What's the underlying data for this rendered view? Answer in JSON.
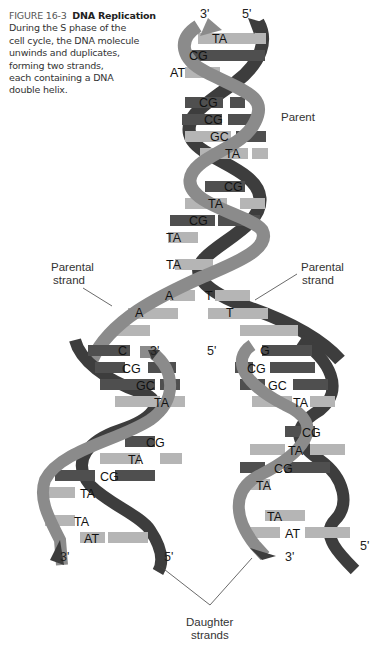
{
  "caption": {
    "figure_number": "FIGURE 16-3",
    "title": "DNA Replication",
    "lines": [
      "During the S phase of the",
      "cell cycle, the DNA molecule",
      "unwinds and duplicates,",
      "forming two strands,",
      "each containing a DNA",
      "double helix."
    ]
  },
  "labels": {
    "parent": "Parent",
    "parental_strand_left": [
      "Parental",
      "strand"
    ],
    "parental_strand_right": [
      "Parental",
      "strand"
    ],
    "daughter_strands": [
      "Daughter",
      "strands"
    ]
  },
  "strand_ends": {
    "top_left": "3'",
    "top_right": "5'",
    "left_helix_top": "3'",
    "right_helix_top": "5'",
    "left_helix_bottom_left": "3'",
    "left_helix_bottom_right": "5'",
    "right_helix_bottom_left": "3'",
    "right_helix_bottom_right": "5'"
  },
  "base_pairs": {
    "parent": [
      "TA",
      "CG",
      "AT",
      "CG",
      "CG",
      "GC",
      "TA",
      "CG",
      "TA",
      "CG",
      "TA",
      "TA"
    ],
    "unzipped_left": [
      "A",
      "A",
      "C"
    ],
    "unzipped_right": [
      "T",
      "T",
      "G"
    ],
    "left_daughter": [
      "CG",
      "GC",
      "TA",
      "CG",
      "TA",
      "CG",
      "TA",
      "TA",
      "AT"
    ],
    "right_daughter": [
      "CG",
      "GC",
      "TA",
      "CG",
      "TA",
      "CG",
      "TA",
      "TA",
      "AT"
    ]
  },
  "colors": {
    "backbone_light": "#8a8a8a",
    "backbone_dark": "#3a3a3a",
    "base_light": "#b3b3b3",
    "base_dark": "#4d4d4d",
    "text": "#222222"
  }
}
